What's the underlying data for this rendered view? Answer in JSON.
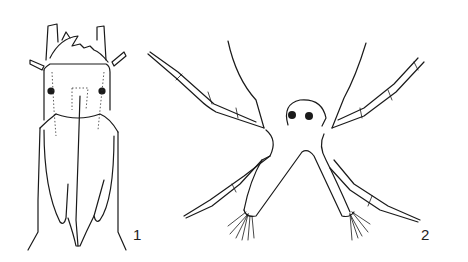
{
  "figure": {
    "panels": [
      {
        "label": "1",
        "subject": "dorsal view of elongated insect larva head/thorax"
      },
      {
        "label": "2",
        "subject": "nauplius-like larva with segmented appendages"
      }
    ]
  }
}
